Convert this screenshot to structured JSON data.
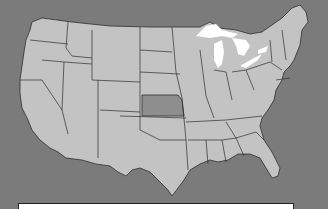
{
  "map": {
    "title": "United States",
    "highlighted_state": "Kansas",
    "colors": {
      "background": "#7b7b7b",
      "land": "#c3c3c3",
      "highlight": "#8e8e8e",
      "lakes": "#ffffff",
      "borders": "#2e2e2e"
    }
  },
  "caption": {
    "text": ""
  }
}
